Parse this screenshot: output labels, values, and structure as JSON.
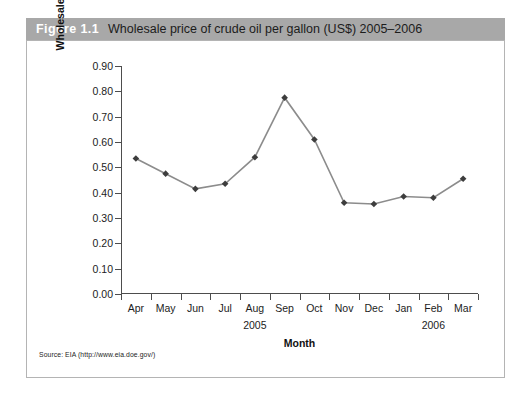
{
  "figure": {
    "number_label": "Figure 1.1",
    "caption": "Wholesale price of crude oil per gallon (US$) 2005–2006",
    "source_note": "Source: EIA (http://www.eia.doe.gov/)",
    "caption_bar_color": "#a8a8a8",
    "panel_border_color": "#b4b4b4"
  },
  "chart_data": {
    "type": "line",
    "title": "Wholesale price of crude oil per gallon (US$) 2005–2006",
    "xlabel": "Month",
    "ylabel": "Wholesale Price of Crude Oil per Gallon (US$)",
    "ylabel_line1": "Wholesale Price of Crude Oil per",
    "ylabel_line2": "Gallon (US$)",
    "categories": [
      "Apr",
      "May",
      "Jun",
      "Jul",
      "Aug",
      "Sep",
      "Oct",
      "Nov",
      "Dec",
      "Jan",
      "Feb",
      "Mar"
    ],
    "values": [
      0.535,
      0.475,
      0.415,
      0.435,
      0.54,
      0.775,
      0.61,
      0.36,
      0.355,
      0.385,
      0.38,
      0.455
    ],
    "ylim": [
      0.0,
      0.9
    ],
    "ytick_step": 0.1,
    "ytick_labels": [
      "0.90",
      "0.80",
      "0.70",
      "0.60",
      "0.50",
      "0.40",
      "0.30",
      "0.20",
      "0.10",
      "0.00"
    ],
    "ytick_values": [
      0.9,
      0.8,
      0.7,
      0.6,
      0.5,
      0.4,
      0.3,
      0.2,
      0.1,
      0.0
    ],
    "group_labels": [
      {
        "label": "2005",
        "start_index": 0,
        "end_index": 8
      },
      {
        "label": "2006",
        "start_index": 9,
        "end_index": 11
      }
    ],
    "grid": false,
    "legend": false,
    "line_color": "#8c8c8c",
    "marker_color": "#3d3d3d",
    "marker_shape": "diamond",
    "axis_color": "#4d4d4d"
  }
}
